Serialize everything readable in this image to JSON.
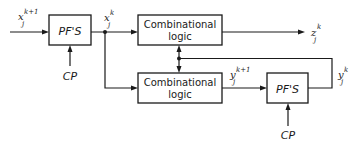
{
  "diagram": {
    "blocks": {
      "pfs_left": {
        "label": "PF'S"
      },
      "comb_top": {
        "line1": "Combinational",
        "line2": "logic"
      },
      "comb_bottom": {
        "line1": "Combinational",
        "line2": "logic"
      },
      "pfs_right": {
        "label": "PF'S"
      }
    },
    "signals": {
      "input": {
        "var": "x",
        "sup": "k+1",
        "sub": "j"
      },
      "state_x": {
        "var": "x",
        "sup": "k",
        "sub": "j"
      },
      "output_z": {
        "var": "z",
        "sup": "k",
        "sub": "j"
      },
      "next_y": {
        "var": "y",
        "sup": "k+1",
        "sub": "j"
      },
      "state_y": {
        "var": "y",
        "sup": "k",
        "sub": "j"
      }
    },
    "clocks": {
      "left": "CP",
      "right": "CP"
    }
  }
}
